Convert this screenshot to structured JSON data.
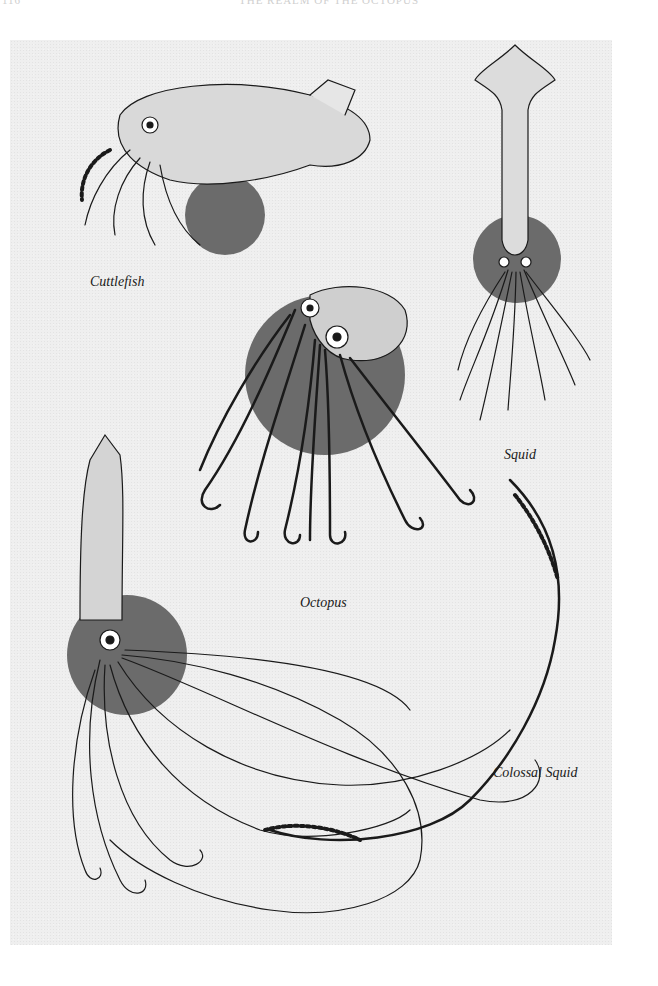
{
  "page": {
    "header_page_number": "116",
    "header_running_title": "THE REALM OF THE OCTOPUS"
  },
  "plate": {
    "background_color": "#efefef",
    "accent_circle_color": "#6b6b6b",
    "ink_color": "#1a1a1a",
    "illustrations": [
      {
        "id": "cuttlefish",
        "label": "Cuttlefish"
      },
      {
        "id": "squid",
        "label": "Squid"
      },
      {
        "id": "octopus",
        "label": "Octopus"
      },
      {
        "id": "colossal-squid",
        "label": "Colossal Squid"
      }
    ]
  }
}
